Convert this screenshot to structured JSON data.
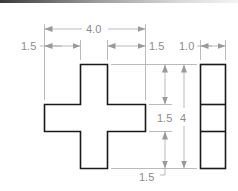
{
  "figure": {
    "type": "orthographic technical drawing",
    "views": [
      "front-view-cross",
      "side-view"
    ],
    "colors": {
      "outline": "#1a1a1a",
      "dimension": "#a9a9a9",
      "text": "#8c8c8c"
    }
  },
  "dimensions": {
    "overall_width": "4.0",
    "left_arm": "1.5",
    "right_arm": "1.5",
    "side_thickness": "1.0",
    "upper_arm_height": "1.5",
    "overall_height": "4",
    "lower_arm": "1.5"
  }
}
